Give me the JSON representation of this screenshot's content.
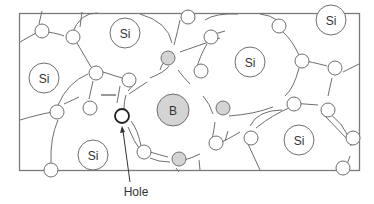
{
  "diagram": {
    "atoms": [
      {
        "label": "Si",
        "type": "silicon"
      },
      {
        "label": "Si",
        "type": "silicon"
      },
      {
        "label": "Si",
        "type": "silicon"
      },
      {
        "label": "Si",
        "type": "silicon"
      },
      {
        "label": "Si",
        "type": "silicon"
      },
      {
        "label": "Si",
        "type": "silicon"
      },
      {
        "label": "B",
        "type": "boron"
      }
    ],
    "charge_symbol": "—",
    "hole_label": "Hole",
    "colors": {
      "boron_fill": "#d4d4d4",
      "line": "#6e6e6e",
      "hole_outline": "#222222"
    }
  }
}
